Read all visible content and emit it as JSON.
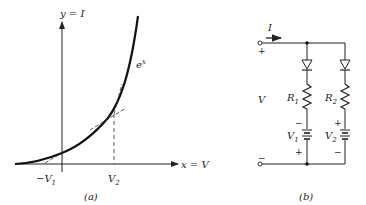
{
  "figure_a": {
    "caption": "(a)",
    "y_axis_label": "y = I",
    "x_axis_label": "x = V",
    "curve_label": "e",
    "curve_label_sup": "x",
    "tick_neg": "−V",
    "tick_neg_sub": "1",
    "tick_pos": "V",
    "tick_pos_sub": "2"
  },
  "figure_b": {
    "caption": "(b)",
    "current_label": "I",
    "voltage_label": "V",
    "top_terminal_sign": "+",
    "bottom_terminal_sign": "−",
    "branch1": {
      "resistor": "R",
      "resistor_sub": "1",
      "battery": "V",
      "battery_sub": "1",
      "sign_top": "−",
      "sign_bottom": "+"
    },
    "branch2": {
      "resistor": "R",
      "resistor_sub": "2",
      "battery": "V",
      "battery_sub": "2",
      "sign_top": "+",
      "sign_bottom": "−"
    }
  }
}
